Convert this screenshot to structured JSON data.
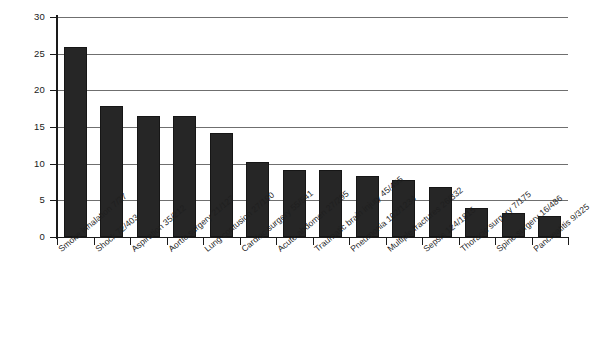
{
  "chart_data": {
    "type": "bar",
    "title": "",
    "xlabel": "",
    "ylabel": "",
    "ylim": [
      0,
      30
    ],
    "yticks": [
      0,
      5,
      10,
      15,
      20,
      25,
      30
    ],
    "ytick_labels": [
      "0",
      "5",
      "10",
      "15",
      "20",
      "25",
      "30"
    ],
    "grid": true,
    "legend": "none",
    "orientation": "vertical",
    "bar_color": "#262626",
    "categories": [
      "Smoke inhalation 7/27",
      "Shock 72/403",
      "Aspiration 35/212",
      "Aortic surgery 21/127",
      "Lung contusion 27/190",
      "Cardiac surgery 55/541",
      "Acute abdomen 27/295",
      "Traumatic brain injury 45/495",
      "Pneumonia 102/1234",
      "Multiple fractures 26/332",
      "Sepsis 124/1815",
      "Thoracic surgery 7/175",
      "Spine surgery 16/486",
      "Pancreatitis 9/325"
    ],
    "values": [
      25.9,
      17.9,
      16.5,
      16.5,
      14.2,
      10.2,
      9.2,
      9.1,
      8.3,
      7.8,
      6.8,
      4.0,
      3.3,
      2.8
    ]
  },
  "axes": {
    "y_tick_labels": [
      "30",
      "25",
      "20",
      "15",
      "10",
      "5",
      "0"
    ]
  },
  "title_strip": {
    "text": ""
  }
}
